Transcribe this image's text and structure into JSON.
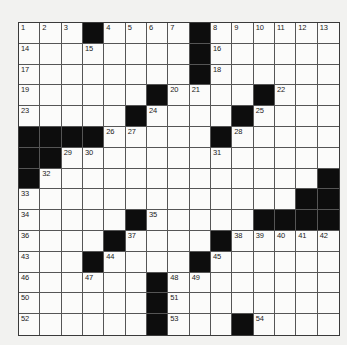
{
  "puzzle": {
    "rows": 15,
    "cols": 15,
    "colors": {
      "background": "#f2f2f0",
      "cell": "#fbfbfa",
      "block": "#0d0d0d",
      "line": "#555555"
    },
    "grid": [
      [
        "1",
        "2",
        "3",
        "#",
        "4",
        "5",
        "6",
        "7",
        "#",
        "8",
        "9",
        "10",
        "11",
        "12",
        "13"
      ],
      [
        "14",
        "",
        "",
        "15",
        "",
        "",
        "",
        "",
        "#",
        "16",
        "",
        "",
        "",
        "",
        ""
      ],
      [
        "17",
        "",
        "",
        "",
        "",
        "",
        "",
        "",
        "#",
        "18",
        "",
        "",
        "",
        "",
        ""
      ],
      [
        "19",
        "",
        "",
        "",
        "",
        "",
        "#",
        "20",
        "21",
        "",
        "",
        "#",
        "22",
        "",
        ""
      ],
      [
        "23",
        "",
        "",
        "",
        "",
        "#",
        "24",
        "",
        "",
        "",
        "#",
        "25",
        "",
        "",
        ""
      ],
      [
        "#",
        "#",
        "#",
        "#",
        "26",
        "27",
        "",
        "",
        "",
        "#",
        "28",
        "",
        "",
        "",
        ""
      ],
      [
        "#",
        "#",
        "29",
        "30",
        "",
        "",
        "",
        "",
        "",
        "31",
        "",
        "",
        "",
        "",
        ""
      ],
      [
        "#",
        "32",
        "",
        "",
        "",
        "",
        "",
        "",
        "",
        "",
        "",
        "",
        "",
        "",
        "#"
      ],
      [
        "33",
        "",
        "",
        "",
        "",
        "",
        "",
        "",
        "",
        "",
        "",
        "",
        "",
        "#",
        "#"
      ],
      [
        "34",
        "",
        "",
        "",
        "",
        "#",
        "35",
        "",
        "",
        "",
        "",
        "#",
        "#",
        "#",
        "#"
      ],
      [
        "36",
        "",
        "",
        "",
        "#",
        "37",
        "",
        "",
        "",
        "#",
        "38",
        "39",
        "40",
        "41",
        "42"
      ],
      [
        "43",
        "",
        "",
        "#",
        "44",
        "",
        "",
        "",
        "#",
        "45",
        "",
        "",
        "",
        "",
        ""
      ],
      [
        "46",
        "",
        "",
        "47",
        "",
        "",
        "#",
        "48",
        "49",
        "",
        "",
        "",
        "",
        "",
        ""
      ],
      [
        "50",
        "",
        "",
        "",
        "",
        "",
        "#",
        "51",
        "",
        "",
        "",
        "",
        "",
        "",
        ""
      ],
      [
        "52",
        "",
        "",
        "",
        "",
        "",
        "#",
        "53",
        "",
        "",
        "#",
        "54",
        "",
        ""
      ]
    ]
  }
}
